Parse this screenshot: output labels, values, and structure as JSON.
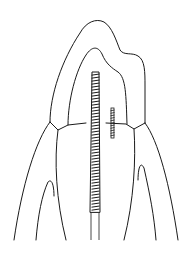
{
  "diagram": {
    "parts": [
      {
        "id": "crown-outline",
        "label": "tooth outline"
      },
      {
        "id": "pulp-chamber",
        "label": "pulp chamber"
      },
      {
        "id": "main-file",
        "label": "endodontic file in canal"
      },
      {
        "id": "small-screw",
        "label": "small instrument / post"
      },
      {
        "id": "gum-line-left",
        "label": "gingiva left"
      },
      {
        "id": "gum-line-right",
        "label": "gingiva right"
      },
      {
        "id": "bone-left",
        "label": "alveolar bone left"
      },
      {
        "id": "bone-right",
        "label": "alveolar bone right"
      }
    ],
    "colors": {
      "stroke": "#1a1a1a",
      "background": "#ffffff"
    }
  }
}
